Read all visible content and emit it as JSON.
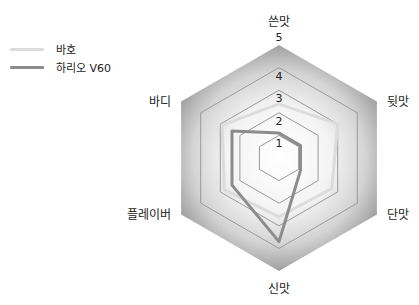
{
  "chart_data": {
    "type": "radar",
    "title": "",
    "axes": [
      "쓴맛",
      "뒷맛",
      "단맛",
      "신맛",
      "플레이버",
      "바디"
    ],
    "scale": {
      "min": 0,
      "max": 5,
      "ticks": [
        "1",
        "2",
        "3",
        "4",
        "5"
      ]
    },
    "series": [
      {
        "name": "바호",
        "color": "#dcdcdc",
        "values": [
          2.4,
          3.0,
          2.7,
          2.6,
          2.8,
          2.9
        ]
      },
      {
        "name": "하리오 V60",
        "color": "#8c8c8c",
        "values": [
          1.1,
          1.1,
          1.1,
          3.7,
          2.4,
          2.4
        ]
      }
    ],
    "legend_position": "top-left",
    "grid": true
  },
  "legend": [
    {
      "label": "바호",
      "color": "#dcdcdc"
    },
    {
      "label": "하리오 V60",
      "color": "#8c8c8c"
    }
  ],
  "colors": {
    "gradient_center": "#ffffff",
    "gradient_edge": "#9c9c9c",
    "grid_line": "#9a9a9a"
  }
}
